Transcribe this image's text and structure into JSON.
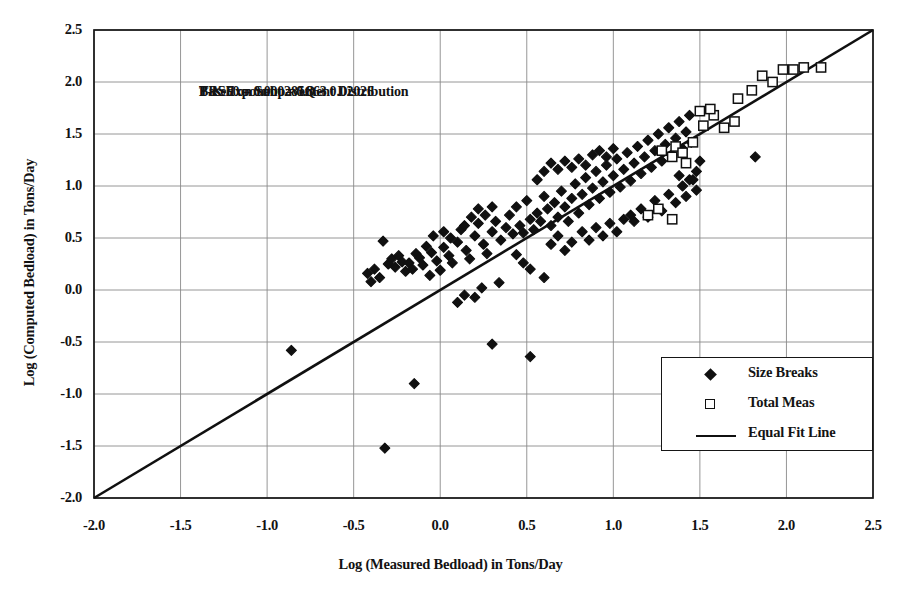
{
  "chart_data": {
    "type": "scatter",
    "title": "",
    "xlabel": "Log (Measured Bedload) in Tons/Day",
    "ylabel": "Log (Computed Bedload) in Tons/Day",
    "xlim": [
      -2.0,
      2.5
    ],
    "ylim": [
      -2.0,
      2.5
    ],
    "xticks": [
      "-2.0",
      "-1.5",
      "-1.0",
      "-0.5",
      "0.0",
      "0.5",
      "1.0",
      "1.5",
      "2.0",
      "2.5"
    ],
    "yticks": [
      "2.5",
      "2.0",
      "1.5",
      "1.0",
      "0.5",
      "0.0",
      "-0.5",
      "-1.0",
      "-1.5",
      "-2.0"
    ],
    "xtick_values": [
      -2.0,
      -1.5,
      -1.0,
      -0.5,
      0.0,
      0.5,
      1.0,
      1.5,
      2.0,
      2.5
    ],
    "ytick_values": [
      2.5,
      2.0,
      1.5,
      1.0,
      0.5,
      0.0,
      -0.5,
      -1.0,
      -1.5,
      -2.0
    ],
    "grid": true,
    "legend_position": "lower-right",
    "annotation_lines": [
      "Based on Subpavement Distribution",
      "TRS50 = 0.000285Q + 0.02026",
      "P-K Exponent = 0.863"
    ],
    "colors": {
      "marker": "#101010",
      "line": "#101010",
      "grid": "#8a8a8a",
      "axis": "#161616",
      "background": "#ffffff"
    },
    "series": [
      {
        "name": "Size Breaks",
        "marker": "filled-diamond",
        "points": [
          [
            -0.86,
            -0.58
          ],
          [
            -0.32,
            -1.52
          ],
          [
            -0.15,
            -0.9
          ],
          [
            -0.33,
            0.47
          ],
          [
            -0.3,
            0.25
          ],
          [
            -0.28,
            0.3
          ],
          [
            -0.26,
            0.22
          ],
          [
            -0.24,
            0.33
          ],
          [
            -0.22,
            0.27
          ],
          [
            -0.2,
            0.18
          ],
          [
            -0.18,
            0.26
          ],
          [
            -0.16,
            0.2
          ],
          [
            -0.14,
            0.35
          ],
          [
            -0.12,
            0.31
          ],
          [
            -0.1,
            0.24
          ],
          [
            -0.08,
            0.42
          ],
          [
            -0.06,
            0.14
          ],
          [
            -0.05,
            0.36
          ],
          [
            -0.02,
            0.28
          ],
          [
            0.0,
            0.19
          ],
          [
            0.02,
            0.41
          ],
          [
            0.05,
            0.33
          ],
          [
            0.07,
            0.26
          ],
          [
            0.1,
            0.46
          ],
          [
            0.12,
            0.58
          ],
          [
            0.15,
            0.38
          ],
          [
            0.17,
            0.3
          ],
          [
            0.2,
            0.52
          ],
          [
            0.22,
            0.64
          ],
          [
            0.25,
            0.44
          ],
          [
            0.27,
            0.35
          ],
          [
            0.3,
            0.56
          ],
          [
            0.32,
            0.66
          ],
          [
            0.34,
            0.07
          ],
          [
            0.35,
            0.48
          ],
          [
            0.38,
            0.6
          ],
          [
            0.4,
            0.72
          ],
          [
            0.42,
            0.54
          ],
          [
            0.44,
            0.8
          ],
          [
            0.46,
            0.62
          ],
          [
            0.48,
            0.55
          ],
          [
            0.5,
            0.86
          ],
          [
            0.52,
            0.68
          ],
          [
            0.54,
            0.58
          ],
          [
            0.56,
            0.74
          ],
          [
            0.58,
            0.66
          ],
          [
            0.6,
            0.9
          ],
          [
            0.62,
            0.78
          ],
          [
            0.64,
            0.62
          ],
          [
            0.66,
            0.84
          ],
          [
            0.68,
            0.7
          ],
          [
            0.7,
            0.95
          ],
          [
            0.72,
            0.8
          ],
          [
            0.74,
            0.66
          ],
          [
            0.76,
            0.88
          ],
          [
            0.78,
            1.02
          ],
          [
            0.8,
            0.74
          ],
          [
            0.82,
            0.92
          ],
          [
            0.84,
            1.08
          ],
          [
            0.86,
            0.82
          ],
          [
            0.88,
            0.98
          ],
          [
            0.9,
            1.14
          ],
          [
            0.92,
            0.88
          ],
          [
            0.94,
            1.04
          ],
          [
            0.96,
            1.2
          ],
          [
            0.98,
            0.94
          ],
          [
            1.0,
            1.1
          ],
          [
            1.02,
            1.26
          ],
          [
            1.04,
            0.99
          ],
          [
            1.06,
            1.16
          ],
          [
            1.08,
            1.32
          ],
          [
            1.1,
            1.05
          ],
          [
            1.12,
            1.22
          ],
          [
            1.14,
            1.38
          ],
          [
            1.16,
            1.12
          ],
          [
            1.18,
            1.28
          ],
          [
            1.2,
            1.44
          ],
          [
            1.22,
            1.18
          ],
          [
            1.24,
            1.34
          ],
          [
            1.26,
            1.5
          ],
          [
            1.28,
            1.24
          ],
          [
            1.3,
            1.4
          ],
          [
            1.32,
            1.56
          ],
          [
            1.34,
            1.3
          ],
          [
            1.36,
            1.46
          ],
          [
            1.38,
            1.62
          ],
          [
            1.4,
            1.36
          ],
          [
            1.42,
            1.52
          ],
          [
            1.44,
            1.68
          ],
          [
            1.45,
            1.42
          ],
          [
            1.1,
            0.72
          ],
          [
            1.12,
            0.66
          ],
          [
            1.16,
            0.78
          ],
          [
            1.2,
            0.7
          ],
          [
            1.24,
            0.86
          ],
          [
            1.28,
            0.76
          ],
          [
            1.32,
            0.92
          ],
          [
            1.36,
            0.84
          ],
          [
            1.4,
            1.0
          ],
          [
            1.42,
            0.9
          ],
          [
            1.44,
            1.06
          ],
          [
            1.48,
            0.96
          ],
          [
            0.52,
            0.2
          ],
          [
            0.6,
            0.12
          ],
          [
            0.3,
            -0.52
          ],
          [
            0.52,
            -0.64
          ],
          [
            0.2,
            -0.07
          ],
          [
            0.24,
            0.02
          ],
          [
            0.44,
            0.34
          ],
          [
            0.48,
            0.26
          ],
          [
            0.1,
            -0.12
          ],
          [
            0.14,
            -0.05
          ],
          [
            -0.35,
            0.12
          ],
          [
            -0.38,
            0.2
          ],
          [
            -0.4,
            0.08
          ],
          [
            -0.42,
            0.16
          ],
          [
            0.64,
            0.44
          ],
          [
            0.68,
            0.52
          ],
          [
            0.72,
            0.38
          ],
          [
            0.76,
            0.46
          ],
          [
            0.82,
            0.56
          ],
          [
            0.86,
            0.48
          ],
          [
            0.9,
            0.6
          ],
          [
            0.94,
            0.52
          ],
          [
            0.98,
            0.64
          ],
          [
            1.02,
            0.56
          ],
          [
            1.06,
            0.68
          ],
          [
            1.82,
            1.28
          ],
          [
            0.56,
            1.06
          ],
          [
            0.6,
            1.14
          ],
          [
            0.64,
            1.22
          ],
          [
            0.68,
            1.16
          ],
          [
            0.72,
            1.24
          ],
          [
            0.76,
            1.18
          ],
          [
            0.8,
            1.26
          ],
          [
            0.84,
            1.2
          ],
          [
            0.88,
            1.3
          ],
          [
            0.92,
            1.34
          ],
          [
            0.96,
            1.28
          ],
          [
            1.0,
            1.36
          ],
          [
            0.18,
            0.7
          ],
          [
            0.22,
            0.78
          ],
          [
            0.26,
            0.72
          ],
          [
            0.3,
            0.8
          ],
          [
            0.14,
            0.62
          ],
          [
            1.48,
            1.14
          ],
          [
            1.5,
            1.24
          ],
          [
            1.46,
            1.06
          ],
          [
            0.06,
            0.5
          ],
          [
            0.02,
            0.56
          ],
          [
            -0.04,
            0.52
          ],
          [
            1.38,
            1.1
          ]
        ]
      },
      {
        "name": "Total Meas",
        "marker": "open-square",
        "points": [
          [
            1.2,
            0.72
          ],
          [
            1.26,
            0.78
          ],
          [
            1.34,
            0.68
          ],
          [
            1.28,
            1.34
          ],
          [
            1.36,
            1.38
          ],
          [
            1.4,
            1.32
          ],
          [
            1.46,
            1.42
          ],
          [
            1.52,
            1.58
          ],
          [
            1.58,
            1.68
          ],
          [
            1.64,
            1.56
          ],
          [
            1.5,
            1.72
          ],
          [
            1.56,
            1.74
          ],
          [
            1.7,
            1.62
          ],
          [
            1.72,
            1.84
          ],
          [
            1.8,
            1.92
          ],
          [
            1.86,
            2.06
          ],
          [
            1.92,
            2.0
          ],
          [
            1.98,
            2.12
          ],
          [
            2.04,
            2.12
          ],
          [
            2.1,
            2.14
          ],
          [
            2.2,
            2.14
          ],
          [
            1.42,
            1.22
          ],
          [
            1.34,
            1.28
          ]
        ]
      }
    ],
    "reference_line": {
      "name": "Equal Fit Line",
      "from": [
        -2.0,
        -2.0
      ],
      "to": [
        2.5,
        2.5
      ]
    }
  },
  "legend": {
    "items": [
      {
        "label": "Size Breaks",
        "key": "filled-diamond"
      },
      {
        "label": "Total Meas",
        "key": "open-square"
      },
      {
        "label": "Equal Fit Line",
        "key": "line"
      }
    ]
  }
}
